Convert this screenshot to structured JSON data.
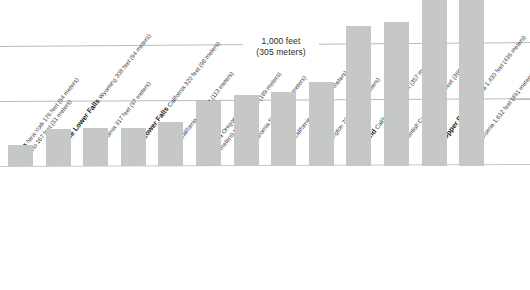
{
  "chart_data": {
    "type": "bar",
    "title": "",
    "subtitle": "",
    "xlabel": "",
    "ylabel": "height",
    "unit_primary": "feet",
    "unit_secondary": "meters",
    "ylim": [
      0,
      1800
    ],
    "grid": true,
    "gridlines": [
      {
        "value": 0,
        "label": ""
      },
      {
        "value": 500,
        "label": ""
      },
      {
        "value": 1000,
        "label": "1,000 feet (305 meters)"
      }
    ],
    "legend_position": "none",
    "annotations": [
      {
        "line1": "1,000 feet",
        "line2": "(305 meters)",
        "at_value": 1000
      }
    ],
    "bar_color": "#c6c7c7",
    "gridline_color": "#b9bcbe",
    "background_color": "#ffffff",
    "categories": [
      "Niagara",
      "Yellowstone Lower Falls",
      "Vernal",
      "Yosemite Lower Falls",
      "Illilouette",
      "Multnomah",
      "Nevada",
      "Bridalveil",
      "Fairy",
      "Silver Strand",
      "Takakkaw",
      "Yosemite Upper Falls",
      "Ribbon"
    ],
    "values": [
      176,
      308,
      317,
      320,
      370,
      542,
      594,
      620,
      700,
      1170,
      1200,
      1430,
      1612
    ],
    "values_meters": [
      54,
      94,
      97,
      98,
      113,
      165,
      181,
      189,
      213,
      357,
      366,
      436,
      491
    ],
    "bars": [
      {
        "name": "Niagara",
        "region": "New York",
        "detail_primary": "176 feet (54 meters)",
        "detail_secondary": "Ontario 167 feet (51 meters)",
        "feet": 176,
        "meters": 54
      },
      {
        "name": "Yellowstone Lower Falls",
        "region": "Wyoming",
        "detail_primary": "308 feet (94 meters)",
        "detail_secondary": "",
        "feet": 308,
        "meters": 94
      },
      {
        "name": "Vernal",
        "region": "California",
        "detail_primary": "317 feet (97 meters)",
        "detail_secondary": "",
        "feet": 317,
        "meters": 97
      },
      {
        "name": "Yosemite Lower Falls",
        "region": "California",
        "detail_primary": "320 feet (98 meters)",
        "detail_secondary": "",
        "feet": 320,
        "meters": 98
      },
      {
        "name": "Illilouette",
        "region": "California",
        "detail_primary": "370 feet (113 meters)",
        "detail_secondary": "",
        "feet": 370,
        "meters": 113
      },
      {
        "name": "Multnomah",
        "region": "Oregon",
        "detail_primary": "542 feet",
        "detail_secondary": "(165 meters) total—620 feet (189 meters)",
        "feet": 542,
        "meters": 165
      },
      {
        "name": "Nevada",
        "region": "California",
        "detail_primary": "594 feet (181 meters)",
        "detail_secondary": "",
        "feet": 594,
        "meters": 181
      },
      {
        "name": "Bridalveil",
        "region": "California",
        "detail_primary": "620 feet (189 meters)",
        "detail_secondary": "",
        "feet": 620,
        "meters": 189
      },
      {
        "name": "Fairy",
        "region": "Washington",
        "detail_primary": "700 feet (213 meters)",
        "detail_secondary": "",
        "feet": 700,
        "meters": 213
      },
      {
        "name": "Silver Strand",
        "region": "California",
        "detail_primary": "1,170 feet (357 meters)",
        "detail_secondary": "",
        "feet": 1170,
        "meters": 357
      },
      {
        "name": "Takakkaw",
        "region": "British Columbia",
        "detail_primary": "1,200 feet (366 meters)",
        "detail_secondary": "",
        "feet": 1200,
        "meters": 366
      },
      {
        "name": "Yosemite Upper Falls",
        "region": "California",
        "detail_primary": "1,430 feet (436 meters)",
        "detail_secondary": "",
        "feet": 1430,
        "meters": 436
      },
      {
        "name": "Ribbon",
        "region": "California",
        "detail_primary": "1,612 feet (491 meters)",
        "detail_secondary": "",
        "feet": 1612,
        "meters": 491
      }
    ]
  }
}
